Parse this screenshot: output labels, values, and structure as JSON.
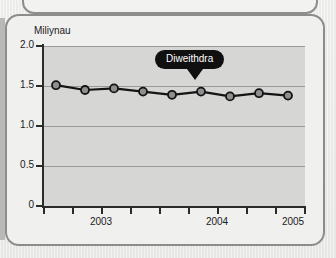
{
  "chart_data": {
    "type": "line",
    "title": "",
    "unit_label": "Miliynau",
    "xlabel": "",
    "ylabel": "Miliynau",
    "ylim": [
      0,
      2.0
    ],
    "yticks": [
      "0",
      "0.5",
      "1.0",
      "1.5",
      "2.0"
    ],
    "ytick_values": [
      0,
      0.5,
      1.0,
      1.5,
      2.0
    ],
    "grid": true,
    "legend": "none",
    "xtick_labels": [
      "2003",
      "2004",
      "2005"
    ],
    "xtick_label_values": [
      2003,
      2004,
      2005
    ],
    "series": [
      {
        "name": "Diweithdra",
        "values": [
          1.51,
          1.45,
          1.47,
          1.43,
          1.39,
          1.43,
          1.37,
          1.41,
          1.38
        ],
        "x": [
          2002.75,
          2003.0,
          2003.25,
          2003.5,
          2003.75,
          2004.0,
          2004.25,
          2004.5,
          2004.75
        ],
        "marker": "circle",
        "line_color": "#141414",
        "marker_fill": "#8f8f8f",
        "marker_edge": "#141414"
      }
    ],
    "annotations": [
      {
        "text": "Diweithdra",
        "style": "callout-bubble",
        "background": "#101010",
        "text_color": "#ffffff"
      }
    ],
    "colors": {
      "plot_background": "#d6d6d4",
      "card_background": "#f0f0ef",
      "page_background": "#e8e8e6",
      "axis": "#2b2b2b",
      "gridline": "#9a9a98",
      "border": "#8c8c8b"
    }
  }
}
